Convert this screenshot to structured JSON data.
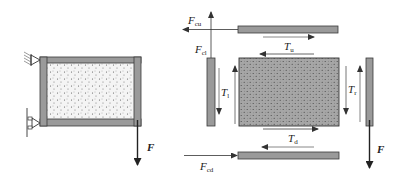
{
  "figure": {
    "type": "free-body diagram",
    "colors": {
      "member": "#9a9a9a",
      "member_stroke": "#3a3a3a",
      "infill_left": "#f4f4f4",
      "infill_right": "#a8a8a8",
      "arrow": "#333333"
    },
    "left_panel": {
      "force_label": {
        "symbol": "F",
        "sub": ""
      }
    },
    "right_panel": {
      "labels": {
        "F_cu": {
          "symbol": "F",
          "sub": "cu"
        },
        "F_cl": {
          "symbol": "F",
          "sub": "cl"
        },
        "F_cd": {
          "symbol": "F",
          "sub": "cd"
        },
        "T_u": {
          "symbol": "T",
          "sub": "u"
        },
        "T_l": {
          "symbol": "T",
          "sub": "l"
        },
        "T_r": {
          "symbol": "T",
          "sub": "r"
        },
        "T_d": {
          "symbol": "T",
          "sub": "d"
        },
        "F": {
          "symbol": "F",
          "sub": ""
        }
      }
    }
  }
}
